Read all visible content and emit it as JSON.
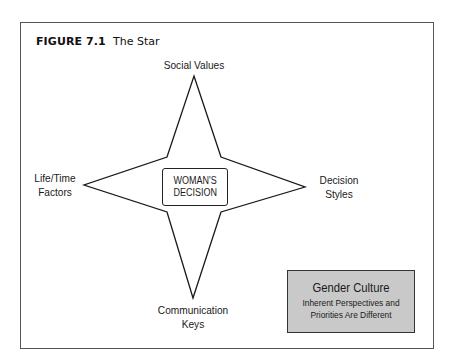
{
  "figure": {
    "number": "FIGURE 7.1",
    "title": "The Star"
  },
  "star": {
    "center_label": "WOMAN'S\nDECISION",
    "points": {
      "top": "Social Values",
      "left": "Life/Time\nFactors",
      "right": "Decision\nStyles",
      "bottom": "Communication\nKeys"
    },
    "stroke_color": "#1a1a1a"
  },
  "note_box": {
    "title": "Gender Culture",
    "subtitle": "Inherent Perspectives and\nPriorities Are Different",
    "fill_color": "#c9c9c9"
  }
}
